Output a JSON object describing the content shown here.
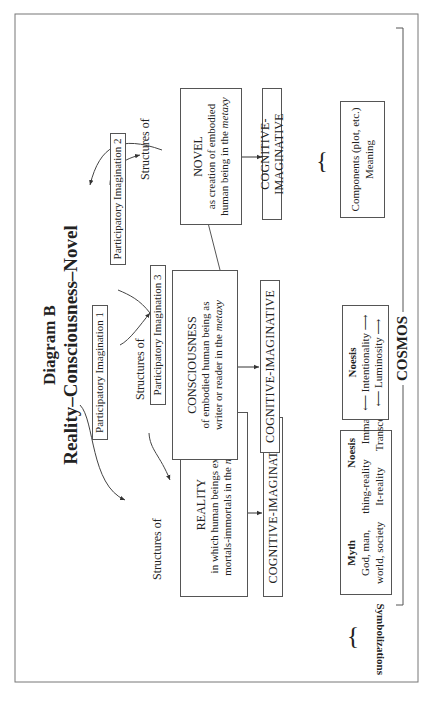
{
  "running_head": "",
  "diagram": {
    "label": "Diagram B",
    "subtitle": "Reality–Consciousness–Novel",
    "participatory": [
      "Participatory Imagination 1",
      "Participatory Imagination 2",
      "Participatory Imagination 3"
    ],
    "structures_of": "Structures of",
    "nodes": {
      "reality": {
        "title": "REALITY",
        "line1": "in which human beings exist as",
        "line2": "mortals-immortals in the ",
        "italic": "metaxy"
      },
      "consciousness": {
        "title": "CONSCIOUSNESS",
        "line1": "of embodied human being as",
        "line2": "writer or reader in the ",
        "italic": "metaxy"
      },
      "novel": {
        "title": "NOVEL",
        "line1": "as creation of embodied",
        "line2": "human being in the ",
        "italic": "metaxy"
      }
    },
    "cognitive": "COGNITIVE-IMAGINATIVE",
    "symbolizations_label": "Symbolizations",
    "reality_symbols": {
      "col1_header": "Myth",
      "col2_header": "Noesis",
      "rows": [
        [
          "God, man,",
          "thing-reality",
          "Immanent"
        ],
        [
          "world, society",
          "It-reality",
          "Transcendent"
        ]
      ]
    },
    "consciousness_symbols": {
      "header": "Noesis",
      "items": [
        "Intentionality",
        "Luminosity"
      ]
    },
    "novel_symbols": {
      "line1": "Components (plot, etc.)",
      "line2": "Meaning"
    },
    "cosmos": "COSMOS"
  }
}
